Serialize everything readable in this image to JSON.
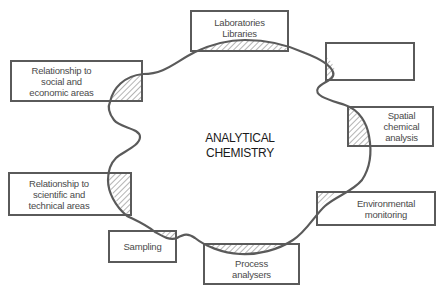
{
  "diagram": {
    "center": {
      "title": "ANALYTICAL\nCHEMISTRY"
    },
    "boxes": [
      {
        "id": "social-economic",
        "label": "Relationship to\nsocial and\neconomic areas"
      },
      {
        "id": "laboratories-libraries",
        "label": "Laboratories\nLibraries"
      },
      {
        "id": "empty",
        "label": ""
      },
      {
        "id": "spatial-chemical-analysis",
        "label": "Spatial\nchemical\nanalysis"
      },
      {
        "id": "environmental-monitoring",
        "label": "Environmental\nmonitoring"
      },
      {
        "id": "process-analysers",
        "label": "Process\nanalysers"
      },
      {
        "id": "sampling",
        "label": "Sampling"
      },
      {
        "id": "scientific-technical",
        "label": "Relationship to\nscientific and\ntechnical areas"
      }
    ],
    "colors": {
      "stroke": "#5a5a5a",
      "text": "#4a4a4a",
      "title": "#1a1a1a",
      "hatch": "#6a6a6a",
      "background": "#ffffff"
    }
  }
}
